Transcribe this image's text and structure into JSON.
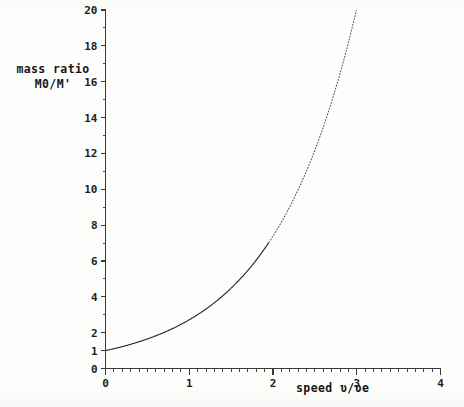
{
  "chart_data": {
    "type": "line",
    "title": "",
    "xlabel": "speed ʋ/ʋe",
    "ylabel_line1": "mass ratio",
    "ylabel_line2": "M0/M'",
    "xlim": [
      0,
      4
    ],
    "ylim": [
      0,
      20
    ],
    "grid": false,
    "legend": null,
    "x_ticks_major": [
      0,
      1,
      2,
      3,
      4
    ],
    "x_tick_labels": [
      "0",
      "1",
      "2",
      "3",
      "4"
    ],
    "x_minor_step": 0.1,
    "y_ticks_major": [
      0,
      1,
      2,
      4,
      6,
      8,
      10,
      12,
      14,
      16,
      18,
      20
    ],
    "y_tick_labels": [
      "0",
      "1",
      "2",
      "4",
      "6",
      "8",
      "10",
      "12",
      "14",
      "16",
      "18",
      "20"
    ],
    "y_minor_ticks": [
      3,
      5,
      7,
      9,
      11,
      13,
      15,
      17,
      19
    ],
    "equation": "M0/M' = exp(v/ve)",
    "series": [
      {
        "name": "mass ratio curve",
        "style_solid_until_x": 1.95,
        "style_dotted_after_x": 1.95,
        "x": [
          0.0,
          0.1,
          0.2,
          0.3,
          0.4,
          0.5,
          0.6,
          0.7,
          0.8,
          0.9,
          1.0,
          1.1,
          1.2,
          1.3,
          1.4,
          1.5,
          1.6,
          1.7,
          1.8,
          1.9,
          2.0,
          2.1,
          2.2,
          2.3,
          2.4,
          2.5,
          2.6,
          2.7,
          2.8,
          2.9,
          2.9957
        ],
        "values": [
          1.0,
          1.105,
          1.221,
          1.35,
          1.492,
          1.649,
          1.822,
          2.014,
          2.226,
          2.46,
          2.718,
          3.004,
          3.32,
          3.669,
          4.055,
          4.482,
          4.953,
          5.474,
          6.05,
          6.686,
          7.389,
          8.166,
          9.025,
          9.974,
          11.023,
          12.182,
          13.464,
          14.88,
          16.445,
          18.174,
          20.0
        ]
      }
    ]
  },
  "axis_titles": {
    "y_line1": "mass ratio",
    "y_line2": "M0/M'",
    "x": "speed ʋ/ʋe"
  }
}
